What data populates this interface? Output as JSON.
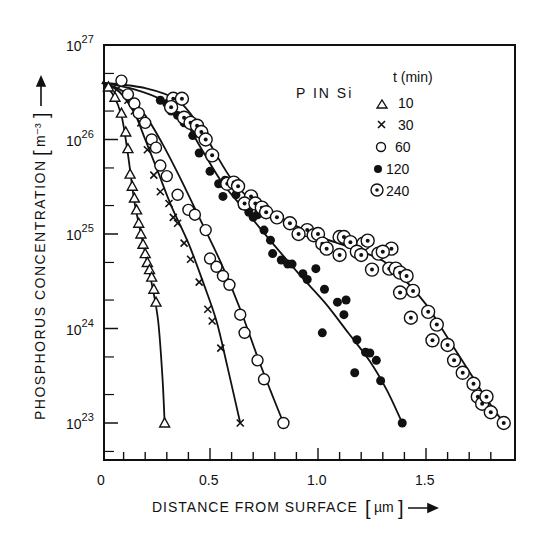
{
  "chart_data": {
    "type": "scatter",
    "title": "P IN Si",
    "xlabel": "DISTANCE FROM SURFACE [µm] →",
    "ylabel": "PHOSPHORUS CONCENTRATION [m⁻³] →",
    "xlim": [
      0,
      1.9
    ],
    "ylim": [
      1e+22,
      1e+27
    ],
    "yscale": "log",
    "x_ticks": [
      0,
      0.5,
      1.0,
      1.5
    ],
    "x_tick_labels": [
      "0",
      "0.5",
      "1.0",
      "1.5"
    ],
    "x_minor_step": 0.1,
    "y_ticks_exp": [
      23,
      24,
      25,
      26,
      27
    ],
    "y_tick_labels": [
      "10^23",
      "10^24",
      "10^25",
      "10^26",
      "10^27"
    ],
    "grid": false,
    "legend": {
      "title": "t (min)",
      "position": "upper right",
      "entries": [
        {
          "marker": "triangle",
          "label": "10"
        },
        {
          "marker": "x",
          "label": "30"
        },
        {
          "marker": "open-circle",
          "label": "60"
        },
        {
          "marker": "filled-circle",
          "label": "120"
        },
        {
          "marker": "dotted-circle",
          "label": "240"
        }
      ]
    },
    "series": [
      {
        "name": "10 min",
        "marker": "triangle",
        "points": [
          [
            0.03,
            3.6e+26
          ],
          [
            0.06,
            2.8e+26
          ],
          [
            0.09,
            1.9e+26
          ],
          [
            0.11,
            1.2e+26
          ],
          [
            0.12,
            8e+25
          ],
          [
            0.13,
            4.3e+25
          ],
          [
            0.14,
            3.2e+25
          ],
          [
            0.15,
            2.4e+25
          ],
          [
            0.16,
            1.8e+25
          ],
          [
            0.17,
            1.3e+25
          ],
          [
            0.18,
            1e+25
          ],
          [
            0.19,
            7.8e+24
          ],
          [
            0.2,
            6.2e+24
          ],
          [
            0.21,
            5e+24
          ],
          [
            0.22,
            4.2e+24
          ],
          [
            0.23,
            3.5e+24
          ],
          [
            0.24,
            2.6e+24
          ],
          [
            0.25,
            1.9e+24
          ],
          [
            0.29,
            1e+23
          ]
        ],
        "curve": [
          [
            0.0,
            4e+26
          ],
          [
            0.05,
            3e+26
          ],
          [
            0.09,
            1.8e+26
          ],
          [
            0.12,
            7e+25
          ],
          [
            0.15,
            2.2e+25
          ],
          [
            0.19,
            8e+24
          ],
          [
            0.23,
            3e+24
          ],
          [
            0.26,
            1.2e+24
          ],
          [
            0.28,
            3e+23
          ],
          [
            0.29,
            1e+23
          ]
        ]
      },
      {
        "name": "30 min",
        "marker": "x",
        "points": [
          [
            0.07,
            3.4e+26
          ],
          [
            0.12,
            2.6e+26
          ],
          [
            0.15,
            2e+26
          ],
          [
            0.18,
            1.5e+26
          ],
          [
            0.21,
            7.8e+25
          ],
          [
            0.24,
            4.2e+25
          ],
          [
            0.27,
            2.8e+25
          ],
          [
            0.31,
            2.1e+25
          ],
          [
            0.33,
            1.5e+25
          ],
          [
            0.35,
            1.3e+25
          ],
          [
            0.38,
            8e+24
          ],
          [
            0.41,
            5.4e+24
          ],
          [
            0.45,
            3.1e+24
          ],
          [
            0.49,
            1.6e+24
          ],
          [
            0.51,
            1.2e+24
          ],
          [
            0.55,
            6.2e+23
          ],
          [
            0.64,
            1e+23
          ]
        ],
        "curve": [
          [
            0.0,
            4e+26
          ],
          [
            0.08,
            3.2e+26
          ],
          [
            0.15,
            1.9e+26
          ],
          [
            0.2,
            1e+26
          ],
          [
            0.26,
            4.5e+25
          ],
          [
            0.32,
            2e+25
          ],
          [
            0.4,
            8e+24
          ],
          [
            0.47,
            3e+24
          ],
          [
            0.53,
            1.2e+24
          ],
          [
            0.58,
            4e+23
          ],
          [
            0.64,
            1e+23
          ]
        ]
      },
      {
        "name": "60 min",
        "marker": "open-circle",
        "points": [
          [
            0.09,
            4.2e+26
          ],
          [
            0.12,
            3e+26
          ],
          [
            0.15,
            2.4e+26
          ],
          [
            0.17,
            1.9e+26
          ],
          [
            0.2,
            1.5e+26
          ],
          [
            0.23,
            1e+26
          ],
          [
            0.25,
            8.2e+25
          ],
          [
            0.27,
            5.3e+25
          ],
          [
            0.3,
            4.1e+25
          ],
          [
            0.35,
            2.6e+25
          ],
          [
            0.4,
            1.8e+25
          ],
          [
            0.43,
            1.6e+25
          ],
          [
            0.48,
            1.1e+25
          ],
          [
            0.5,
            5.5e+24
          ],
          [
            0.53,
            4.5e+24
          ],
          [
            0.56,
            3.6e+24
          ],
          [
            0.59,
            2.9e+24
          ],
          [
            0.64,
            1.4e+24
          ],
          [
            0.66,
            9e+23
          ],
          [
            0.72,
            4.6e+23
          ],
          [
            0.75,
            2.9e+23
          ],
          [
            0.84,
            1e+23
          ]
        ],
        "curve": [
          [
            0.0,
            4e+26
          ],
          [
            0.1,
            3.2e+26
          ],
          [
            0.2,
            1.8e+26
          ],
          [
            0.28,
            9e+25
          ],
          [
            0.36,
            4e+25
          ],
          [
            0.45,
            1.5e+25
          ],
          [
            0.55,
            5e+24
          ],
          [
            0.64,
            1.6e+24
          ],
          [
            0.72,
            5e+23
          ],
          [
            0.78,
            2.2e+23
          ],
          [
            0.84,
            1e+23
          ]
        ]
      },
      {
        "name": "120 min",
        "marker": "filled-circle",
        "points": [
          [
            0.27,
            2.6e+26
          ],
          [
            0.3,
            2.4e+26
          ],
          [
            0.32,
            2e+26
          ],
          [
            0.35,
            1.8e+26
          ],
          [
            0.38,
            1.5e+26
          ],
          [
            0.42,
            1.1e+26
          ],
          [
            0.45,
            7.2e+25
          ],
          [
            0.5,
            4.6e+25
          ],
          [
            0.54,
            3.4e+25
          ],
          [
            0.57,
            3.7e+25
          ],
          [
            0.56,
            2.5e+25
          ],
          [
            0.62,
            2.6e+25
          ],
          [
            0.65,
            2e+25
          ],
          [
            0.68,
            1.7e+25
          ],
          [
            0.7,
            1.5e+25
          ],
          [
            0.72,
            1.6e+25
          ],
          [
            0.75,
            1.1e+25
          ],
          [
            0.78,
            8.6e+24
          ],
          [
            0.79,
            6.2e+24
          ],
          [
            0.83,
            5.3e+24
          ],
          [
            0.86,
            4.8e+24
          ],
          [
            0.88,
            4.8e+24
          ],
          [
            0.93,
            3.8e+24
          ],
          [
            0.95,
            3.3e+24
          ],
          [
            0.99,
            4.3e+24
          ],
          [
            1.03,
            2.6e+24
          ],
          [
            1.09,
            1.9e+24
          ],
          [
            1.13,
            2e+24
          ],
          [
            1.02,
            9e+23
          ],
          [
            1.12,
            1.4e+24
          ],
          [
            1.18,
            7.6e+23
          ],
          [
            1.22,
            5.6e+23
          ],
          [
            1.17,
            3.4e+23
          ],
          [
            1.24,
            5.5e+23
          ],
          [
            1.27,
            4.6e+23
          ],
          [
            1.29,
            2.8e+23
          ],
          [
            1.39,
            1e+23
          ]
        ],
        "curve": [
          [
            0.0,
            4e+26
          ],
          [
            0.15,
            3.4e+26
          ],
          [
            0.28,
            2.6e+26
          ],
          [
            0.38,
            1.6e+26
          ],
          [
            0.46,
            8e+25
          ],
          [
            0.56,
            3.4e+25
          ],
          [
            0.68,
            1.6e+25
          ],
          [
            0.8,
            7.5e+24
          ],
          [
            0.92,
            3.6e+24
          ],
          [
            1.03,
            1.9e+24
          ],
          [
            1.14,
            9e+23
          ],
          [
            1.24,
            4.5e+23
          ],
          [
            1.32,
            2.2e+23
          ],
          [
            1.39,
            1e+23
          ]
        ]
      },
      {
        "name": "240 min",
        "marker": "dotted-circle",
        "points": [
          [
            0.33,
            2.7e+26
          ],
          [
            0.37,
            2.7e+26
          ],
          [
            0.32,
            2.2e+26
          ],
          [
            0.38,
            1.7e+26
          ],
          [
            0.41,
            1.5e+26
          ],
          [
            0.44,
            1.4e+26
          ],
          [
            0.46,
            1.2e+26
          ],
          [
            0.48,
            1e+26
          ],
          [
            0.51,
            6.8e+25
          ],
          [
            0.58,
            3.4e+25
          ],
          [
            0.61,
            3.5e+25
          ],
          [
            0.63,
            3.2e+25
          ],
          [
            0.69,
            2.5e+25
          ],
          [
            0.66,
            2.1e+25
          ],
          [
            0.71,
            2.1e+25
          ],
          [
            0.74,
            1.9e+25
          ],
          [
            0.76,
            1.7e+25
          ],
          [
            0.81,
            1.5e+25
          ],
          [
            0.87,
            1.3e+25
          ],
          [
            0.95,
            1.1e+25
          ],
          [
            0.91,
            1e+25
          ],
          [
            0.98,
            9.7e+24
          ],
          [
            1.0,
            1e+25
          ],
          [
            1.02,
            7.9e+24
          ],
          [
            1.04,
            7e+24
          ],
          [
            1.1,
            9.3e+24
          ],
          [
            1.12,
            9.3e+24
          ],
          [
            1.15,
            8.2e+24
          ],
          [
            1.21,
            7.9e+24
          ],
          [
            1.23,
            8.5e+24
          ],
          [
            1.1,
            6e+24
          ],
          [
            1.18,
            6.5e+24
          ],
          [
            1.2,
            6e+24
          ],
          [
            1.28,
            6.2e+24
          ],
          [
            1.34,
            7e+24
          ],
          [
            1.3,
            6.5e+24
          ],
          [
            1.25,
            4.2e+24
          ],
          [
            1.33,
            4.3e+24
          ],
          [
            1.36,
            4.3e+24
          ],
          [
            1.38,
            3.9e+24
          ],
          [
            1.41,
            3.6e+24
          ],
          [
            1.38,
            2.4e+24
          ],
          [
            1.44,
            2.5e+24
          ],
          [
            1.43,
            1.3e+24
          ],
          [
            1.51,
            1.5e+24
          ],
          [
            1.55,
            1.1e+24
          ],
          [
            1.53,
            7.5e+23
          ],
          [
            1.6,
            6.7e+23
          ],
          [
            1.63,
            4.6e+23
          ],
          [
            1.67,
            3.4e+23
          ],
          [
            1.72,
            2.6e+23
          ],
          [
            1.74,
            1.9e+23
          ],
          [
            1.76,
            1.6e+23
          ],
          [
            1.78,
            1.9e+23
          ],
          [
            1.8,
            1.3e+23
          ],
          [
            1.86,
            1e+23
          ]
        ],
        "curve": [
          [
            0.0,
            4e+26
          ],
          [
            0.2,
            3.5e+26
          ],
          [
            0.35,
            2.6e+26
          ],
          [
            0.45,
            1.4e+26
          ],
          [
            0.52,
            7.5e+25
          ],
          [
            0.6,
            3.8e+25
          ],
          [
            0.7,
            2.2e+25
          ],
          [
            0.85,
            1.4e+25
          ],
          [
            1.0,
            9.5e+24
          ],
          [
            1.15,
            7.2e+24
          ],
          [
            1.3,
            5.2e+24
          ],
          [
            1.4,
            3.3e+24
          ],
          [
            1.5,
            1.8e+24
          ],
          [
            1.6,
            8e+23
          ],
          [
            1.7,
            3.5e+23
          ],
          [
            1.78,
            1.8e+23
          ],
          [
            1.86,
            1e+23
          ]
        ]
      }
    ]
  },
  "labels": {
    "annotation": "P IN Si",
    "legend_title": "t (min)",
    "legend_10": "10",
    "legend_30": "30",
    "legend_60": "60",
    "legend_120": "120",
    "legend_240": "240",
    "xlabel_text": "DISTANCE FROM SURFACE",
    "xlabel_unit": "µm",
    "ylabel_text": "PHOSPHORUS CONCENTRATION",
    "ylabel_unit": "m⁻³",
    "x_tick_0": "0",
    "x_tick_05": "0.5",
    "x_tick_10": "1.0",
    "x_tick_15": "1.5"
  }
}
